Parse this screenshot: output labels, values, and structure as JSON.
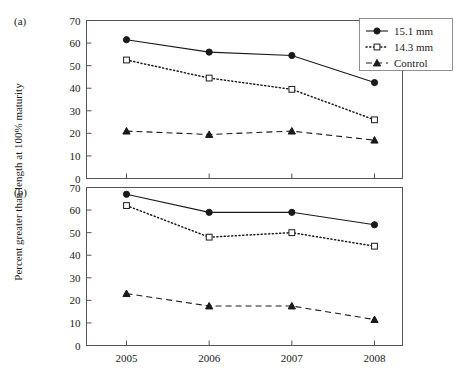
{
  "figure": {
    "ylabel": "Percent greater than length at 100% maturity",
    "panel_a_tag": "(a)",
    "panel_b_tag": "(b)"
  },
  "legend": {
    "position": "top-right",
    "entries": [
      {
        "label": "15.1 mm",
        "marker": "filled-circle",
        "line": "solid"
      },
      {
        "label": "14.3 mm",
        "marker": "open-square",
        "line": "dotted"
      },
      {
        "label": "Control",
        "marker": "filled-triangle",
        "line": "dashed"
      }
    ]
  },
  "chart_data": [
    {
      "type": "line",
      "panel": "(a)",
      "title": "",
      "xlabel": "",
      "ylabel": "Percent greater than length at 100% maturity",
      "categories": [
        "2005",
        "2006",
        "2007",
        "2008"
      ],
      "ylim": [
        0,
        70
      ],
      "yticks": [
        0,
        10,
        20,
        30,
        40,
        50,
        60,
        70
      ],
      "grid": false,
      "series": [
        {
          "name": "15.1 mm",
          "marker": "filled-circle",
          "line": "solid",
          "values": [
            61.5,
            56.0,
            54.5,
            42.5
          ]
        },
        {
          "name": "14.3 mm",
          "marker": "open-square",
          "line": "dotted",
          "values": [
            52.5,
            44.5,
            39.5,
            26.0
          ]
        },
        {
          "name": "Control",
          "marker": "filled-triangle",
          "line": "dashed",
          "values": [
            21.0,
            19.5,
            21.0,
            17.0
          ]
        }
      ]
    },
    {
      "type": "line",
      "panel": "(b)",
      "title": "",
      "xlabel": "",
      "ylabel": "Percent greater than length at 100% maturity",
      "categories": [
        "2005",
        "2006",
        "2007",
        "2008"
      ],
      "ylim": [
        0,
        70
      ],
      "yticks": [
        0,
        10,
        20,
        30,
        40,
        50,
        60,
        70
      ],
      "grid": false,
      "series": [
        {
          "name": "15.1 mm",
          "marker": "filled-circle",
          "line": "solid",
          "values": [
            67.0,
            59.0,
            59.0,
            53.5
          ]
        },
        {
          "name": "14.3 mm",
          "marker": "open-square",
          "line": "dotted",
          "values": [
            62.0,
            48.0,
            50.0,
            44.0
          ]
        },
        {
          "name": "Control",
          "marker": "filled-triangle",
          "line": "dashed",
          "values": [
            23.0,
            17.5,
            17.5,
            11.5
          ]
        }
      ]
    }
  ],
  "axes": {
    "x_tick_labels": [
      "2005",
      "2006",
      "2007",
      "2008"
    ],
    "y_tick_labels_a": [
      "0",
      "10",
      "20",
      "30",
      "40",
      "50",
      "60",
      "70"
    ],
    "y_tick_labels_b": [
      "0",
      "10",
      "20",
      "30",
      "40",
      "50",
      "60",
      "70"
    ]
  }
}
